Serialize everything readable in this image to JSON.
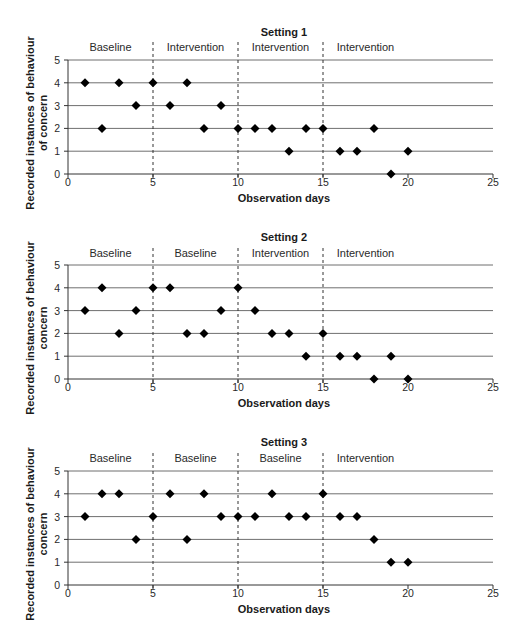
{
  "figure": {
    "caption_partial": ""
  },
  "layout": {
    "x_origin_px": 68,
    "px_per_day": 17,
    "px_per_unit": 22.8,
    "panels": [
      {
        "y_zero_px": 174,
        "title_y": 36,
        "phase_y": 51,
        "tick_y": 186,
        "xlabel_y": 202
      },
      {
        "y_zero_px": 379,
        "title_y": 241,
        "phase_y": 257,
        "tick_y": 391,
        "xlabel_y": 407
      },
      {
        "y_zero_px": 585,
        "title_y": 446,
        "phase_y": 462,
        "tick_y": 597,
        "xlabel_y": 613
      }
    ]
  },
  "chart_data": [
    {
      "type": "scatter",
      "title": "Setting 1",
      "xlabel": "Observation days",
      "ylabel": "Recorded instances of behaviour of concern",
      "ylabel_lines": [
        "Recorded instances of behaviour",
        "of concern"
      ],
      "xlim": [
        0,
        25
      ],
      "ylim": [
        0,
        5
      ],
      "xticks": [
        0,
        5,
        10,
        15,
        20,
        25
      ],
      "yticks": [
        0,
        1,
        2,
        3,
        4,
        5
      ],
      "grid": "horizontal",
      "phase_boundaries": [
        5,
        10,
        15
      ],
      "phases": [
        {
          "label": "Baseline",
          "center": 2.5
        },
        {
          "label": "Intervention",
          "center": 7.5
        },
        {
          "label": "Intervention",
          "center": 12.5
        },
        {
          "label": "Intervention",
          "center": 17.5
        }
      ],
      "x": [
        1,
        2,
        3,
        4,
        5,
        6,
        7,
        8,
        9,
        10,
        11,
        12,
        13,
        14,
        15,
        16,
        17,
        18,
        19,
        20
      ],
      "y": [
        4,
        2,
        4,
        3,
        4,
        3,
        4,
        2,
        3,
        2,
        2,
        2,
        1,
        2,
        2,
        1,
        1,
        2,
        0,
        1
      ]
    },
    {
      "type": "scatter",
      "title": "Setting 2",
      "xlabel": "Observation days",
      "ylabel": "Recorded instances of behaviour concern",
      "ylabel_lines": [
        "Recorded instances of behaviour",
        "concern"
      ],
      "xlim": [
        0,
        25
      ],
      "ylim": [
        0,
        5
      ],
      "xticks": [
        0,
        5,
        10,
        15,
        20,
        25
      ],
      "yticks": [
        0,
        1,
        2,
        3,
        4,
        5
      ],
      "grid": "horizontal",
      "phase_boundaries": [
        5,
        10,
        15
      ],
      "phases": [
        {
          "label": "Baseline",
          "center": 2.5
        },
        {
          "label": "Baseline",
          "center": 7.5
        },
        {
          "label": "Intervention",
          "center": 12.5
        },
        {
          "label": "Intervention",
          "center": 17.5
        }
      ],
      "x": [
        1,
        2,
        3,
        4,
        5,
        6,
        7,
        8,
        9,
        10,
        11,
        12,
        13,
        14,
        15,
        16,
        17,
        18,
        19,
        20
      ],
      "y": [
        3,
        4,
        2,
        3,
        4,
        4,
        2,
        2,
        3,
        4,
        3,
        2,
        2,
        1,
        2,
        1,
        1,
        0,
        1,
        0
      ]
    },
    {
      "type": "scatter",
      "title": "Setting 3",
      "xlabel": "Observation days",
      "ylabel": "Recorded instances of behaviour concern",
      "ylabel_lines": [
        "Recorded instances of behaviour",
        "concern"
      ],
      "xlim": [
        0,
        25
      ],
      "ylim": [
        0,
        5
      ],
      "xticks": [
        0,
        5,
        10,
        15,
        20,
        25
      ],
      "yticks": [
        0,
        1,
        2,
        3,
        4,
        5
      ],
      "grid": "horizontal",
      "phase_boundaries": [
        5,
        10,
        15
      ],
      "phases": [
        {
          "label": "Baseline",
          "center": 2.5
        },
        {
          "label": "Baseline",
          "center": 7.5
        },
        {
          "label": "Baseline",
          "center": 12.5
        },
        {
          "label": "Intervention",
          "center": 17.5
        }
      ],
      "x": [
        1,
        2,
        3,
        4,
        5,
        6,
        7,
        8,
        9,
        10,
        11,
        12,
        13,
        14,
        15,
        16,
        17,
        18,
        19,
        20
      ],
      "y": [
        3,
        4,
        4,
        2,
        3,
        4,
        2,
        4,
        3,
        3,
        3,
        4,
        3,
        3,
        4,
        3,
        3,
        2,
        1,
        1
      ]
    }
  ]
}
